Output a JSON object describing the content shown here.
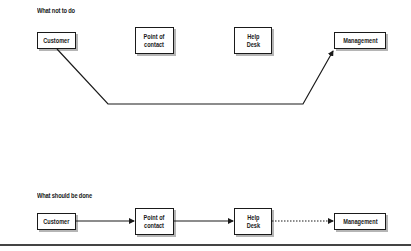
{
  "diagrams": {
    "wrong": {
      "title": "What not to do",
      "nodes": {
        "customer": "Customer",
        "point_of_contact": "Point of\ncontact",
        "help_desk": "Help\nDesk",
        "management": "Management"
      },
      "connection": "Customer → Management (bypassing Point of contact and Help Desk)"
    },
    "right": {
      "title": "What should be done",
      "nodes": {
        "customer": "Customer",
        "point_of_contact": "Point of\ncontact",
        "help_desk": "Help\nDesk",
        "management": "Management"
      },
      "connections": [
        {
          "from": "Customer",
          "to": "Point of contact",
          "style": "solid"
        },
        {
          "from": "Point of contact",
          "to": "Help Desk",
          "style": "solid"
        },
        {
          "from": "Help Desk",
          "to": "Management",
          "style": "dotted"
        }
      ]
    }
  },
  "colors": {
    "line": "#1a1a1a",
    "shadow": "#b5b5b5",
    "background": "#ffffff"
  }
}
